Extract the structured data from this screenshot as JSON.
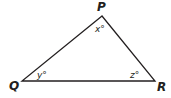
{
  "diagram": {
    "type": "triangle",
    "stroke_color": "#231f20",
    "vertices": [
      {
        "label": "P",
        "x": 102,
        "y": 16
      },
      {
        "label": "Q",
        "x": 22,
        "y": 81
      },
      {
        "label": "R",
        "x": 155,
        "y": 81
      }
    ],
    "angles": [
      {
        "vertex": "P",
        "label": "x°"
      },
      {
        "vertex": "Q",
        "label": "y°"
      },
      {
        "vertex": "R",
        "label": "z°"
      }
    ]
  }
}
